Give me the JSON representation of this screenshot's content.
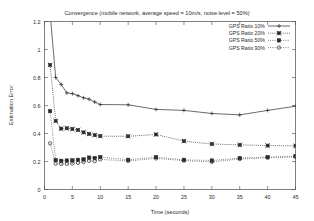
{
  "chart_data": {
    "type": "line",
    "title": "Convergence (mobile network, average speed = 10m/s, noise level = 50%)",
    "xlabel": "Time (seconds)",
    "ylabel": "Estimation Error",
    "xlim": [
      0,
      45
    ],
    "ylim": [
      0,
      1.2
    ],
    "xticks": [
      0,
      5,
      10,
      15,
      20,
      25,
      30,
      35,
      40,
      45
    ],
    "xticklabels": [
      "0",
      "5",
      "10",
      "15",
      "20",
      "25",
      "30",
      "35",
      "40",
      "45"
    ],
    "yticks": [
      0,
      0.2,
      0.4,
      0.6,
      0.8,
      1,
      1.2
    ],
    "yticklabels": [
      "0",
      "0.2",
      "0.4",
      "0.6",
      "0.8",
      "1",
      "1.2"
    ],
    "grid": false,
    "legend_position": "top-right",
    "x": [
      1,
      2,
      3,
      4,
      5,
      6,
      7,
      8,
      9,
      10,
      15,
      20,
      25,
      30,
      35,
      40,
      45
    ],
    "series": [
      {
        "name": "GPS Ratio 10%",
        "marker": "plus",
        "linestyle": "solid",
        "values": [
          1.26,
          0.8,
          0.75,
          0.69,
          0.685,
          0.67,
          0.655,
          0.645,
          0.625,
          0.607,
          0.605,
          0.572,
          0.565,
          0.543,
          0.533,
          0.565,
          0.595
        ]
      },
      {
        "name": "GPS Ratio 20%",
        "marker": "cross-square",
        "linestyle": "dotted",
        "values": [
          0.89,
          0.49,
          0.435,
          0.437,
          0.432,
          0.425,
          0.408,
          0.397,
          0.388,
          0.381,
          0.38,
          0.393,
          0.345,
          0.325,
          0.319,
          0.314,
          0.312
        ]
      },
      {
        "name": "GPS Ratio 50%",
        "marker": "square",
        "linestyle": "dotted2",
        "values": [
          0.56,
          0.21,
          0.205,
          0.207,
          0.208,
          0.212,
          0.215,
          0.228,
          0.225,
          0.232,
          0.212,
          0.231,
          0.212,
          0.207,
          0.224,
          0.232,
          0.238
        ]
      },
      {
        "name": "GPS Ratio 90%",
        "marker": "circle",
        "linestyle": "dotted2",
        "values": [
          0.33,
          0.185,
          0.182,
          0.183,
          0.186,
          0.19,
          0.196,
          0.205,
          0.202,
          0.215,
          0.204,
          0.222,
          0.206,
          0.197,
          0.218,
          0.226,
          0.233
        ]
      }
    ]
  },
  "colors": {
    "background": "#ffffff",
    "axis": "#4a4a4a",
    "ink": "#2a2a2a"
  }
}
